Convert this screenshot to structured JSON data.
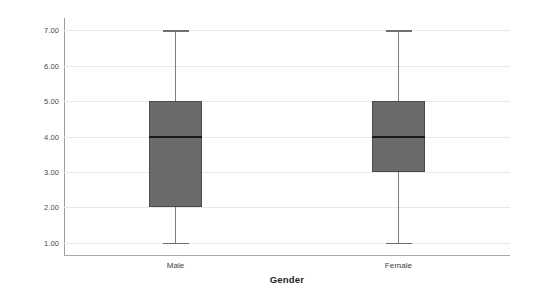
{
  "chart_data": {
    "type": "box",
    "title": "",
    "xlabel": "Gender",
    "ylabel": "Purchase",
    "categories": [
      "Male",
      "Female"
    ],
    "ytick_labels": [
      "7.00",
      "6.00",
      "5.00",
      "4.00",
      "3.00",
      "2.00",
      "1.00"
    ],
    "ytick_values": [
      7,
      6,
      5,
      4,
      3,
      2,
      1
    ],
    "ylim": [
      0.65,
      7.35
    ],
    "grid": true,
    "legend": "none",
    "box_color": "#6b6b6b",
    "box_border_color": "#4a4a4a",
    "median_color": "#1a1a1a",
    "whisker_color": "#7d7d7d",
    "gridline_color": "#e9e9e9",
    "axis_color": "#a9a9a9",
    "background": "#ffffff",
    "series": [
      {
        "name": "Male",
        "whisker_low": 1.0,
        "q1": 2.0,
        "median": 4.0,
        "q3": 5.0,
        "whisker_high": 7.0
      },
      {
        "name": "Female",
        "whisker_low": 1.0,
        "q1": 3.0,
        "median": 4.0,
        "q3": 5.0,
        "whisker_high": 7.0
      }
    ]
  }
}
